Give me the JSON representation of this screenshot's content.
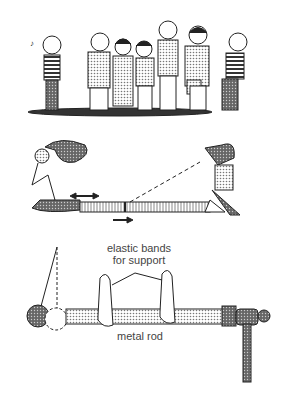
{
  "panels": [
    {
      "name": "crowd",
      "description": "Group of people standing in a line"
    },
    {
      "name": "slinky-demo",
      "description": "Two people with a stretched spring showing longitudinal wave; arrows indicate oscillation and wave direction"
    },
    {
      "name": "rod-pendulum",
      "description": "Pendulum ball touching a metal rod supported by elastic bands, struck by a hammer"
    }
  ],
  "labels": {
    "elastic_bands": "elastic bands",
    "for_support": "for support",
    "metal_rod": "metal rod"
  },
  "colors": {
    "ink": "#222222",
    "shade": "#9a9a9a",
    "light": "#d8d8d8"
  }
}
